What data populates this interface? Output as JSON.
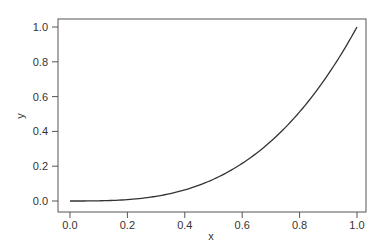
{
  "chart_data": {
    "type": "line",
    "title": "",
    "xlabel": "x",
    "ylabel": "y",
    "xlim": [
      -0.04,
      1.04
    ],
    "ylim": [
      -0.04,
      1.04
    ],
    "grid": false,
    "legend": null,
    "x_ticks": [
      "0.0",
      "0.2",
      "0.4",
      "0.6",
      "0.8",
      "1.0"
    ],
    "y_ticks": [
      "0.0",
      "0.2",
      "0.4",
      "0.6",
      "0.8",
      "1.0"
    ],
    "series": [
      {
        "name": "y = x^3",
        "x": [
          0.0,
          0.1,
          0.2,
          0.3,
          0.4,
          0.5,
          0.6,
          0.7,
          0.8,
          0.9,
          1.0
        ],
        "y": [
          0.0,
          0.001,
          0.008,
          0.027,
          0.064,
          0.125,
          0.216,
          0.343,
          0.512,
          0.729,
          1.0
        ]
      }
    ]
  }
}
